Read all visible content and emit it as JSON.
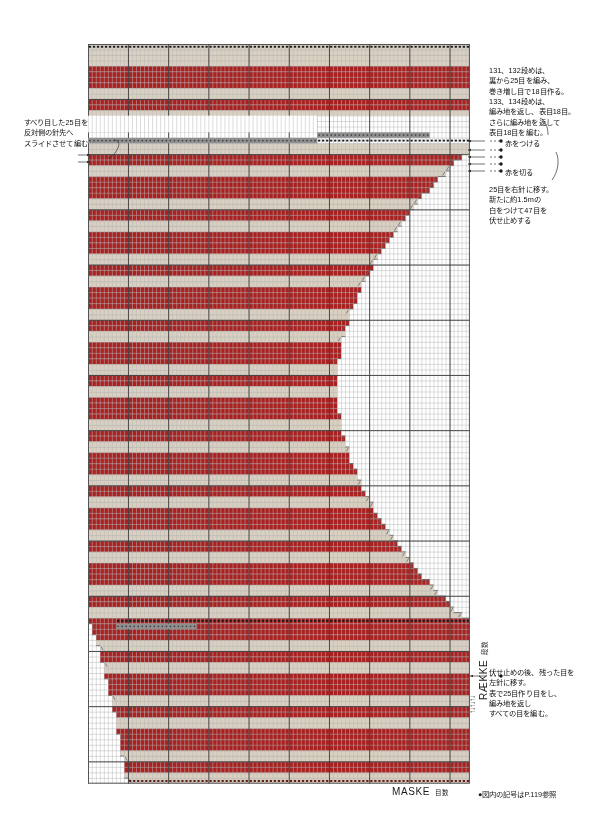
{
  "page": {
    "footnote": "●図内の記号はP.119参照"
  },
  "axes": {
    "x_label": "MASKE",
    "x_label_jp": "目数",
    "y_label": "RÆKKE",
    "y_label_jp": "段数",
    "row_ticks": [
      10,
      20,
      30,
      40,
      50,
      60,
      70,
      80,
      90,
      100,
      110,
      120,
      130,
      134
    ],
    "stitch_ticks": [
      10,
      20,
      30,
      40,
      50,
      60,
      70,
      80,
      90
    ],
    "direction_arrows": "↑↓↑↓↑↓"
  },
  "annotations": {
    "left_slip": "すべり目した25目を\n反対側の針先へ\nスライドさせて編む",
    "top_right": "131、132段めは、\n裏から25目を編み、\n巻き増し目で18目作る。\n133、134段めは、\n編み地を返し、表目18目。\nさらに編み地を返して\n表目18目を編む。",
    "attach_red": "赤をつける",
    "cut_red": "赤を切る",
    "middle_right": "25目を右針に移す。\n新たに約1.5mの\n白をつけて47目を\n伏せ止めする",
    "bottom_right": "伏せ止めの後、残った目を\n左針に移す。\n表で25目作り目をし、\n編み地を返し\nすべての目を編む。"
  },
  "colors": {
    "red": "#a92121",
    "red_dark": "#8e1a1a",
    "beige": "#d9d0c1",
    "beige_dark": "#c9bfae",
    "white": "#ffffff",
    "grid": "#b9b9b9",
    "grid_major": "#3a3a3a",
    "gray_marker": "#8f8f8f",
    "black": "#1a1a1a",
    "border": "#555555"
  },
  "chart_data": {
    "type": "heatmap",
    "xlabel": "MASKE",
    "ylabel": "RÆKKE",
    "cols": 95,
    "rows": 134,
    "cell_w": 4.02,
    "cell_h": 5.52,
    "major_col_every": 10,
    "major_row_every": 10,
    "legend": [
      {
        "key": "red",
        "label": "赤",
        "color": "#a92121"
      },
      {
        "key": "beige",
        "label": "白",
        "color": "#d9d0c1"
      },
      {
        "key": "empty",
        "label": "編まない",
        "color": "#ffffff"
      }
    ],
    "stripe_sequence": [
      {
        "color": "red",
        "rows": 4
      },
      {
        "color": "beige",
        "rows": 2
      },
      {
        "color": "red",
        "rows": 2
      },
      {
        "color": "beige",
        "rows": 2
      }
    ],
    "shape_notes": "Upper block full width rows 135-118; right edge steps inward from row 117 to row 62 forming a concave curve, then steps back out to full width by row 30; lower block left edge steps in at rows 1-28.",
    "symbols": [
      {
        "name": "bind-off-dash",
        "glyph": "▬",
        "rows": [
          135,
          116,
          115,
          29
        ]
      },
      {
        "name": "slip-stitch-marker",
        "glyph": "·",
        "rows": [
          117,
          30
        ]
      },
      {
        "name": "decrease",
        "glyph": "╱",
        "note": "along stepped right edge"
      }
    ]
  }
}
